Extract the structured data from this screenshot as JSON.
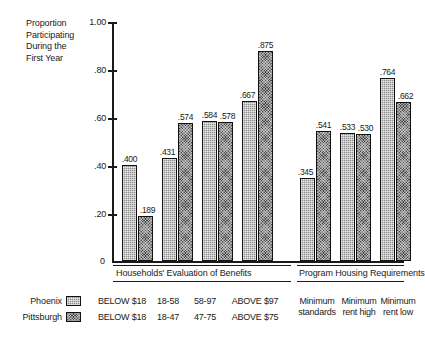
{
  "chart_data": {
    "type": "bar",
    "title": "",
    "ylabel": "Proportion Participating During the First Year",
    "xlabel": "",
    "ylim": [
      0,
      1.0
    ],
    "ytick_labels": [
      "1.00",
      ".80",
      ".60",
      ".40",
      ".20",
      "0"
    ],
    "ytick_values": [
      1.0,
      0.8,
      0.6,
      0.4,
      0.2,
      0.0
    ],
    "grid": false,
    "legend_position": "bottom-left",
    "categories": [
      "BELOW $18",
      "18-58 / 18-47",
      "58-97 / 47-75",
      "ABOVE $97 / ABOVE $75",
      "Minimum standards",
      "Minimum rent high",
      "Minimum rent low"
    ],
    "series": [
      {
        "name": "Phoenix",
        "values": [
          0.4,
          0.431,
          0.584,
          0.667,
          0.345,
          0.533,
          0.764
        ],
        "labels": [
          ".400",
          ".431",
          ".584",
          ".667",
          ".345",
          ".533",
          ".764"
        ],
        "fill": "light-dotted"
      },
      {
        "name": "Pittsburgh",
        "values": [
          0.189,
          0.574,
          0.578,
          0.875,
          0.541,
          0.53,
          0.662
        ],
        "labels": [
          ".189",
          ".574",
          ".578",
          ".875",
          ".541",
          ".530",
          ".662"
        ],
        "fill": "dark-crosshatch"
      }
    ],
    "groups": [
      {
        "title": "Households' Evaluation of Benefits",
        "categories": [
          0,
          1,
          2,
          3
        ]
      },
      {
        "title": "Program Housing Requirements",
        "categories": [
          4,
          5,
          6
        ]
      }
    ]
  },
  "yaxis": {
    "caption": "Proportion Participating During the First Year",
    "caption_lines": [
      "Proportion",
      "Participating",
      "During the",
      "First Year"
    ],
    "ticks": [
      {
        "label": "1.00",
        "value": 1.0
      },
      {
        "label": ".80",
        "value": 0.8
      },
      {
        "label": ".60",
        "value": 0.6
      },
      {
        "label": ".40",
        "value": 0.4
      },
      {
        "label": ".20",
        "value": 0.2
      }
    ],
    "zero_label": "0"
  },
  "bars": [
    {
      "series": "Phoenix",
      "label": ".400",
      "value": 0.4
    },
    {
      "series": "Pittsburgh",
      "label": ".189",
      "value": 0.189
    },
    {
      "series": "Phoenix",
      "label": ".431",
      "value": 0.431
    },
    {
      "series": "Pittsburgh",
      "label": ".574",
      "value": 0.574
    },
    {
      "series": "Phoenix",
      "label": ".584",
      "value": 0.584
    },
    {
      "series": "Pittsburgh",
      "label": ".578",
      "value": 0.578
    },
    {
      "series": "Phoenix",
      "label": ".667",
      "value": 0.667
    },
    {
      "series": "Pittsburgh",
      "label": ".875",
      "value": 0.875
    },
    {
      "series": "Phoenix",
      "label": ".345",
      "value": 0.345
    },
    {
      "series": "Pittsburgh",
      "label": ".541",
      "value": 0.541
    },
    {
      "series": "Phoenix",
      "label": ".533",
      "value": 0.533
    },
    {
      "series": "Pittsburgh",
      "label": ".530",
      "value": 0.53
    },
    {
      "series": "Phoenix",
      "label": ".764",
      "value": 0.764
    },
    {
      "series": "Pittsburgh",
      "label": ".662",
      "value": 0.662
    }
  ],
  "groups": {
    "left_title": "Households' Evaluation of Benefits",
    "right_title": "Program Housing Requirements"
  },
  "legend": {
    "rows": [
      {
        "name": "Phoenix",
        "categories": [
          "BELOW $18",
          "18-58",
          "58-97",
          "ABOVE $97"
        ]
      },
      {
        "name": "Pittsburgh",
        "categories": [
          "BELOW $18",
          "18-47",
          "47-75",
          "ABOVE $75"
        ]
      }
    ],
    "housing_categories": [
      {
        "line1": "Minimum",
        "line2": "standards"
      },
      {
        "line1": "Minimum",
        "line2": "rent high"
      },
      {
        "line1": "Minimum",
        "line2": "rent low"
      }
    ]
  },
  "colors": {
    "ink": "#1a1a1a",
    "phoenix_fill": "#8d8d8d",
    "pittsburgh_fill": "#4a4a4a",
    "background": "#ffffff"
  }
}
